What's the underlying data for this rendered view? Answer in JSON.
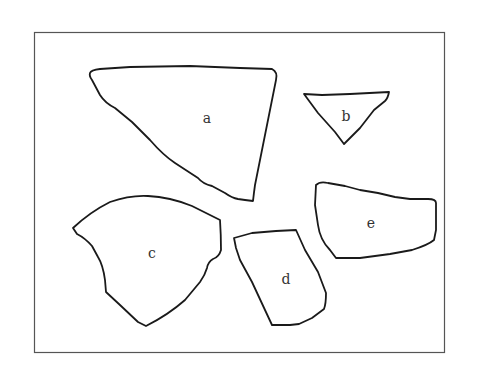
{
  "figure": {
    "frame": {
      "x": 34,
      "y": 32,
      "width": 410,
      "height": 320,
      "stroke": "#555555"
    },
    "fragments": [
      {
        "id": "a",
        "label": "a",
        "label_pos": [
          207,
          118
        ]
      },
      {
        "id": "b",
        "label": "b",
        "label_pos": [
          346,
          116
        ]
      },
      {
        "id": "c",
        "label": "c",
        "label_pos": [
          152,
          253
        ]
      },
      {
        "id": "d",
        "label": "d",
        "label_pos": [
          286,
          279
        ]
      },
      {
        "id": "e",
        "label": "e",
        "label_pos": [
          371,
          223
        ]
      }
    ],
    "stroke_color": "#1a1a1a",
    "background": "#ffffff"
  }
}
